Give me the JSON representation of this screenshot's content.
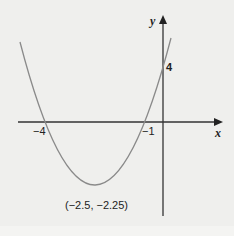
{
  "diagram": {
    "type": "parabola-graph",
    "axes": {
      "x_label": "x",
      "y_label": "y"
    },
    "labels": {
      "root_left": "−4",
      "root_right": "−1",
      "y_intercept": "4",
      "vertex": "(−2.5, −2.25)"
    },
    "colors": {
      "curve": "#8a8a8a",
      "axis": "#333333",
      "background": "#efefed"
    }
  }
}
